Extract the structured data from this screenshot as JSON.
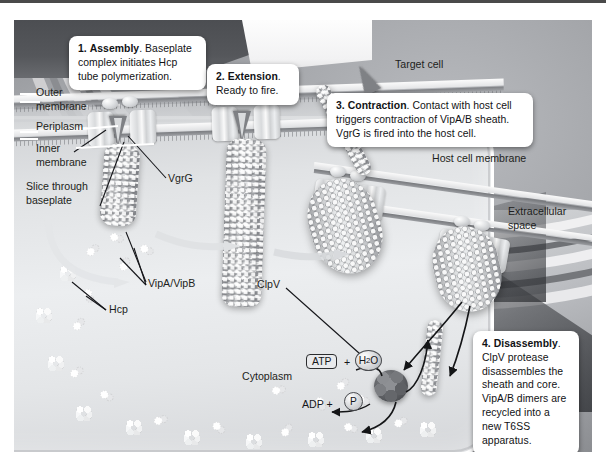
{
  "figure": {
    "type": "labeled biological mechanism diagram",
    "style": "grayscale scientific illustration"
  },
  "callouts": [
    {
      "id": "assembly",
      "number": "1.",
      "heading": "Assembly",
      "body": ". Baseplate complex initiates Hcp tube polymerization."
    },
    {
      "id": "extension",
      "number": "2.",
      "heading": "Extension",
      "body": ". Ready to fire."
    },
    {
      "id": "contraction",
      "number": "3.",
      "heading": "Contraction",
      "body": ". Contact with host cell triggers contraction of VipA/B sheath. VgrG is fired into the host cell."
    },
    {
      "id": "disassembly",
      "number": "4.",
      "heading": "Disassembly",
      "body": ". ClpV protease disassembles the sheath and core. VipA/B dimers are recycled into a new T6SS apparatus."
    }
  ],
  "labels": {
    "outer_membrane": "Outer\nmembrane",
    "periplasm": "Periplasm",
    "inner_membrane": "Inner\nmembrane",
    "slice_through_baseplate": "Slice through\nbaseplate",
    "vgrg": "VgrG",
    "vipa_vipb": "VipA/VipB",
    "hcp": "Hcp",
    "cytoplasm": "Cytoplasm",
    "target_cell": "Target cell",
    "host_cell_membrane": "Host cell membrane",
    "extracellular_space": "Extracellular\nspace",
    "clpv": "ClpV"
  },
  "chemistry": {
    "atp": "ATP",
    "plus_one": "+",
    "water_h": "H",
    "water_sub": "2",
    "water_o": "O",
    "adp": "ADP  +",
    "phosphate": "P"
  },
  "colors": {
    "callout_background": "#ffffff",
    "callout_text": "#111214",
    "label_text": "#1d1e20",
    "extracellular_gray": "#a9abaf",
    "cytoplasm_gray": "#e8eaec",
    "membrane_light": "#fafafa",
    "membrane_dark": "#7d7f83",
    "clpv_dark": "#5e6064",
    "top_rule": "#4a4a4a"
  }
}
